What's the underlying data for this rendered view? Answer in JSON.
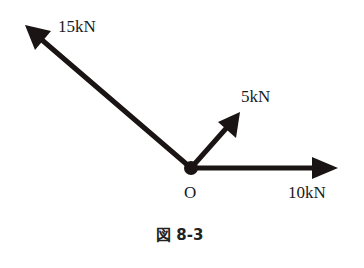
{
  "diagram": {
    "origin_label": "O",
    "forces": [
      {
        "label": "15kN",
        "direction": "up-left"
      },
      {
        "label": "5kN",
        "direction": "up-right"
      },
      {
        "label": "10kN",
        "direction": "right"
      }
    ],
    "caption": "図 8-3",
    "color": "#1a1414"
  }
}
